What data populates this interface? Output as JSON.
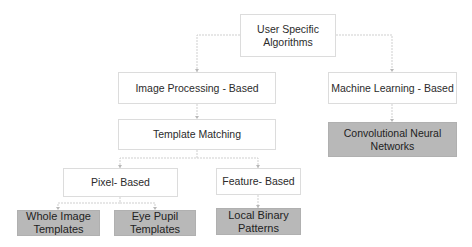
{
  "diagram": {
    "type": "tree",
    "root": {
      "id": "user_specific",
      "label": "User Specific Algorithms",
      "line1": "User Specific",
      "line2": "Algorithms"
    },
    "nodes": {
      "image_processing": {
        "label": "Image Processing - Based"
      },
      "template_matching": {
        "label": "Template Matching"
      },
      "machine_learning": {
        "label": "Machine Learning - Based"
      },
      "cnn": {
        "label": "Convolutional Neural Networks",
        "line1": "Convolutional Neural",
        "line2": "Networks"
      },
      "pixel_based": {
        "label": "Pixel- Based"
      },
      "feature_based": {
        "label": "Feature- Based"
      },
      "whole_image": {
        "label": "Whole Image Templates",
        "line1": "Whole Image",
        "line2": "Templates"
      },
      "eye_pupil": {
        "label": "Eye Pupil Templates",
        "line1": "Eye Pupil",
        "line2": "Templates"
      },
      "lbp": {
        "label": "Local Binary Patterns",
        "line1": "Local Binary",
        "line2": "Patterns"
      }
    },
    "edges": [
      [
        "user_specific",
        "image_processing"
      ],
      [
        "user_specific",
        "machine_learning"
      ],
      [
        "image_processing",
        "template_matching"
      ],
      [
        "template_matching",
        "pixel_based"
      ],
      [
        "template_matching",
        "feature_based"
      ],
      [
        "pixel_based",
        "whole_image"
      ],
      [
        "pixel_based",
        "eye_pupil"
      ],
      [
        "feature_based",
        "lbp"
      ],
      [
        "machine_learning",
        "cnn"
      ]
    ],
    "colors": {
      "leaf_fill": "#b8b8b8",
      "node_border": "#dcdcdc",
      "connector": "#c8c8c8"
    }
  }
}
